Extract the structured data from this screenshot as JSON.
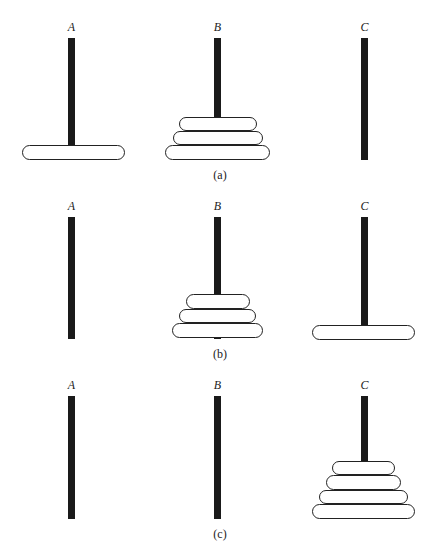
{
  "pegs": [
    "A",
    "B",
    "C"
  ],
  "panels": [
    {
      "caption": "(a)",
      "label_y": 20,
      "peg_top": 38,
      "peg_bottom": 160,
      "caption_y": 168,
      "disks": [
        {
          "peg": "A",
          "x": 22,
          "y": 145,
          "w": 103,
          "h": 15
        },
        {
          "peg": "B",
          "x": 165,
          "y": 145,
          "w": 105,
          "h": 15
        },
        {
          "peg": "B",
          "x": 173,
          "y": 131,
          "w": 90,
          "h": 14
        },
        {
          "peg": "B",
          "x": 179,
          "y": 117,
          "w": 78,
          "h": 14
        }
      ]
    },
    {
      "caption": "(b)",
      "label_y": 199,
      "peg_top": 217,
      "peg_bottom": 339,
      "caption_y": 347,
      "disks": [
        {
          "peg": "B",
          "x": 172,
          "y": 323,
          "w": 91,
          "h": 15
        },
        {
          "peg": "B",
          "x": 179,
          "y": 309,
          "w": 77,
          "h": 14
        },
        {
          "peg": "B",
          "x": 186,
          "y": 294,
          "w": 64,
          "h": 15
        },
        {
          "peg": "C",
          "x": 312,
          "y": 325,
          "w": 103,
          "h": 15
        }
      ]
    },
    {
      "caption": "(c)",
      "label_y": 378,
      "peg_top": 396,
      "peg_bottom": 519,
      "caption_y": 527,
      "disks": [
        {
          "peg": "C",
          "x": 312,
          "y": 504,
          "w": 103,
          "h": 15
        },
        {
          "peg": "C",
          "x": 319,
          "y": 490,
          "w": 89,
          "h": 14
        },
        {
          "peg": "C",
          "x": 326,
          "y": 475,
          "w": 75,
          "h": 15
        },
        {
          "peg": "C",
          "x": 332,
          "y": 461,
          "w": 63,
          "h": 14
        }
      ]
    }
  ],
  "peg_x": {
    "A": 68,
    "B": 214,
    "C": 361
  }
}
